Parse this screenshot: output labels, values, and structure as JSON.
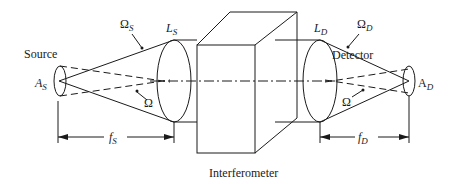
{
  "diagram": {
    "title": "Interferometer",
    "labels": {
      "source": "Source",
      "detector": "Detector",
      "interferometer": "Interferometer",
      "source_area": {
        "main": "A",
        "sub": "S"
      },
      "detector_area": {
        "main": "A",
        "sub": "D"
      },
      "source_lens": {
        "main": "L",
        "sub": "S"
      },
      "detector_lens": {
        "main": "L",
        "sub": "D"
      },
      "source_solid_angle": {
        "main": "Ω",
        "sub": "S"
      },
      "detector_solid_angle": {
        "main": "Ω",
        "sub": "D"
      },
      "solid_angle_left": "Ω",
      "solid_angle_right": "Ω",
      "source_focal_length": {
        "main": "f",
        "sub": "S"
      },
      "detector_focal_length": {
        "main": "f",
        "sub": "D"
      }
    },
    "colors": {
      "line": "#1a1a1a",
      "background": "#ffffff"
    }
  }
}
